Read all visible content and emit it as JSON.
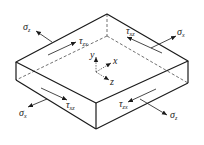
{
  "figure": {
    "colors": {
      "edge": "#1a1a1a",
      "dash": "#333333",
      "text": "#222222",
      "background": "#ffffff"
    },
    "axes": {
      "y": {
        "symbol": "y"
      },
      "x": {
        "symbol": "x"
      },
      "z": {
        "symbol": "z"
      }
    },
    "labels": {
      "sigma_z_top": {
        "base": "σ",
        "sub": "z"
      },
      "tau_zx_top": {
        "base": "τ",
        "sub": "zx"
      },
      "tau_xz_top": {
        "base": "τ",
        "sub": "xz"
      },
      "sigma_x_top": {
        "base": "σ",
        "sub": "x"
      },
      "sigma_x_bottom": {
        "base": "σ",
        "sub": "x"
      },
      "tau_xz_bottom": {
        "base": "τ",
        "sub": "xz"
      },
      "tau_zx_bottom": {
        "base": "τ",
        "sub": "zx"
      },
      "sigma_z_bottom": {
        "base": "σ",
        "sub": "z"
      }
    }
  }
}
